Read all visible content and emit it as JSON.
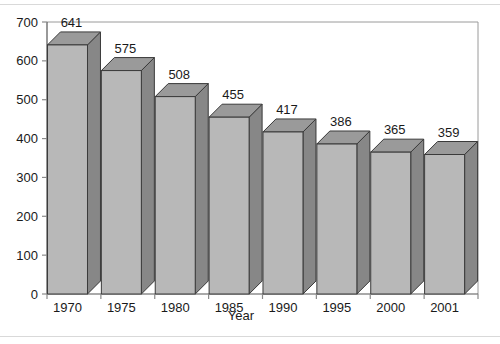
{
  "chart_data": {
    "type": "bar",
    "title": "",
    "subtitle": "",
    "xlabel": "Year",
    "ylabel": "",
    "categories": [
      "1970",
      "1975",
      "1980",
      "1985",
      "1990",
      "1995",
      "2000",
      "2001"
    ],
    "values": [
      641,
      575,
      508,
      455,
      417,
      386,
      365,
      359
    ],
    "data_labels": [
      "641",
      "575",
      "508",
      "455",
      "417",
      "386",
      "365",
      "359"
    ],
    "ylim": [
      0,
      700
    ],
    "ytick_labels": [
      "0",
      "100",
      "200",
      "300",
      "400",
      "500",
      "600",
      "700"
    ],
    "ytick_values": [
      0,
      100,
      200,
      300,
      400,
      500,
      600,
      700
    ],
    "grid": false,
    "legend": null,
    "legend_position": "none",
    "style": "3d-column",
    "colors": {
      "bar_front": "#b8b8b8",
      "bar_top": "#9a9a9a",
      "bar_side": "#878787",
      "bar_outline": "#3a3a3a",
      "axis": "#8a8a8a",
      "text": "#1a1a1a",
      "background": "#ffffff",
      "outer_rule": "#d9d9d9"
    }
  }
}
